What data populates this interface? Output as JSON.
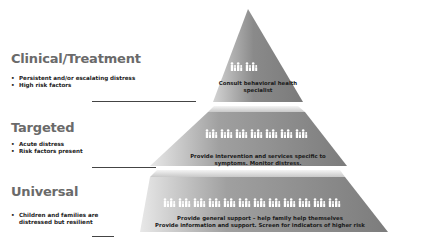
{
  "tiers": [
    {
      "id": "clinical",
      "heading": "Clinical/Treatment",
      "bullets": [
        "Persistent and/or escalating distress",
        "High risk factors"
      ],
      "pyramid_text": [
        "Consult behavioral health",
        "specialist"
      ],
      "people_groups": 1
    },
    {
      "id": "targeted",
      "heading": "Targeted",
      "bullets": [
        "Acute distress",
        "Risk factors present"
      ],
      "pyramid_text": [
        "Provide intervention and services specific to",
        "symptoms. Monitor distress."
      ],
      "people_groups": 4
    },
    {
      "id": "universal",
      "heading": "Universal",
      "bullets": [
        "Children and families are distressed but resilient"
      ],
      "pyramid_text": [
        "Provide general support – help family help themselves",
        "Provide information and support. Screen for indicators of higher risk"
      ],
      "people_groups": 7
    }
  ],
  "colors": {
    "pyramid_dark": "#7a7a7a",
    "pyramid_light": "#d8d8d8",
    "heading": "#6a6a6a",
    "people": "#ffffff"
  }
}
